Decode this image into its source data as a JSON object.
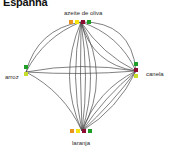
{
  "title": "Espanha",
  "chart_data": {
    "type": "network-diagram",
    "title": "Espanha",
    "background": "#ffffff",
    "edge_color": "#4a4a4a",
    "label_color": "#2b2b2b",
    "nodes": [
      {
        "id": "azeite_de_oliva",
        "label": "azeite de oliva",
        "x": 81,
        "y": 22,
        "label_x": 64,
        "label_y": 10,
        "layout": "horizontal",
        "markers": [
          {
            "name": "marker-orange",
            "color": "#e8941f",
            "dx": -10,
            "dy": 0
          },
          {
            "name": "marker-yellow",
            "color": "#f2e40c",
            "dx": -4,
            "dy": 0
          },
          {
            "name": "marker-darkred",
            "color": "#8c0b2e",
            "dx": 2,
            "dy": 0
          },
          {
            "name": "marker-green",
            "color": "#1f9e27",
            "dx": 8,
            "dy": 0
          }
        ]
      },
      {
        "id": "arroz",
        "label": "arroz",
        "x": 26,
        "y": 72,
        "label_x": 5,
        "label_y": 74,
        "layout": "vertical",
        "markers": [
          {
            "name": "marker-green",
            "color": "#1f9e27",
            "dx": 0,
            "dy": -5
          },
          {
            "name": "marker-yellowgreen",
            "color": "#c6de2b",
            "dx": 0,
            "dy": 2
          }
        ]
      },
      {
        "id": "canela",
        "label": "canela",
        "x": 136,
        "y": 71,
        "label_x": 146,
        "label_y": 71,
        "layout": "vertical",
        "markers": [
          {
            "name": "marker-green",
            "color": "#1f9e27",
            "dx": 0,
            "dy": -7
          },
          {
            "name": "marker-darkred",
            "color": "#8c0b2e",
            "dx": 0,
            "dy": -1
          },
          {
            "name": "marker-yellowgreen",
            "color": "#c6de2b",
            "dx": 0,
            "dy": 5
          }
        ]
      },
      {
        "id": "laranja",
        "label": "laranja",
        "x": 82,
        "y": 131,
        "label_x": 72,
        "label_y": 140,
        "layout": "horizontal",
        "markers": [
          {
            "name": "marker-orange",
            "color": "#e8941f",
            "dx": -10,
            "dy": 0
          },
          {
            "name": "marker-yellow",
            "color": "#f2e40c",
            "dx": -4,
            "dy": 0
          },
          {
            "name": "marker-darkred",
            "color": "#8c0b2e",
            "dx": 2,
            "dy": 0
          },
          {
            "name": "marker-green",
            "color": "#1f9e27",
            "dx": 8,
            "dy": 0
          }
        ]
      }
    ],
    "edges": [
      {
        "source": "azeite_de_oliva",
        "target": "arroz",
        "curve": 14
      },
      {
        "source": "azeite_de_oliva",
        "target": "arroz",
        "curve": 24
      },
      {
        "source": "azeite_de_oliva",
        "target": "canela",
        "curve": -34
      },
      {
        "source": "azeite_de_oliva",
        "target": "canela",
        "curve": -16
      },
      {
        "source": "azeite_de_oliva",
        "target": "canela",
        "curve": 10
      },
      {
        "source": "azeite_de_oliva",
        "target": "canela",
        "curve": 24
      },
      {
        "source": "azeite_de_oliva",
        "target": "laranja",
        "curve": -30
      },
      {
        "source": "azeite_de_oliva",
        "target": "laranja",
        "curve": -18
      },
      {
        "source": "azeite_de_oliva",
        "target": "laranja",
        "curve": -8
      },
      {
        "source": "azeite_de_oliva",
        "target": "laranja",
        "curve": 2
      },
      {
        "source": "azeite_de_oliva",
        "target": "laranja",
        "curve": 12
      },
      {
        "source": "azeite_de_oliva",
        "target": "laranja",
        "curve": 24
      },
      {
        "source": "arroz",
        "target": "canela",
        "curve": -10
      },
      {
        "source": "arroz",
        "target": "canela",
        "curve": 4
      },
      {
        "source": "arroz",
        "target": "laranja",
        "curve": -14
      },
      {
        "source": "canela",
        "target": "laranja",
        "curve": -12
      },
      {
        "source": "canela",
        "target": "laranja",
        "curve": -4
      },
      {
        "source": "canela",
        "target": "laranja",
        "curve": 6
      },
      {
        "source": "canela",
        "target": "laranja",
        "curve": 16
      }
    ]
  }
}
